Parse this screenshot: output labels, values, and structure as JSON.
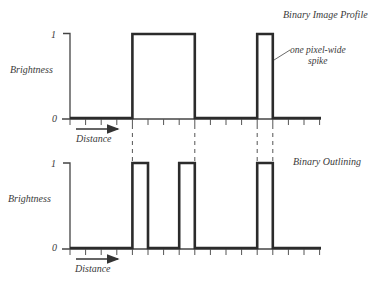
{
  "diagram": {
    "top_panel": {
      "title": "Binary Image Profile",
      "y_label": "Brightness",
      "y_tick_high": "1",
      "y_tick_low": "0",
      "x_label": "Distance",
      "annotation_line1": "one pixel-wide",
      "annotation_line2": "spike",
      "signal_levels_by_pixel": [
        0,
        0,
        0,
        0,
        1,
        1,
        1,
        1,
        0,
        0,
        0,
        0,
        1,
        0,
        0,
        0
      ]
    },
    "bottom_panel": {
      "title": "Binary Outlining",
      "y_label": "Brightness",
      "y_tick_high": "1",
      "y_tick_low": "0",
      "x_label": "Distance",
      "signal_levels_by_pixel": [
        0,
        0,
        0,
        0,
        1,
        0,
        0,
        1,
        0,
        0,
        0,
        0,
        1,
        0,
        0,
        0
      ]
    },
    "alignment_guides": "dashed vertical lines at pixel boundaries 4, 8, 12, 13",
    "colors": {
      "line": "#2b2b2b",
      "text": "#3a3a3a",
      "background": "#ffffff"
    }
  }
}
